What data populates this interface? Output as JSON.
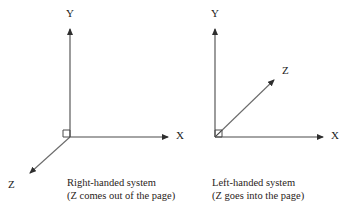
{
  "figure": {
    "type": "diagram",
    "background_color": "#ffffff",
    "line_color": "#4a4a4a",
    "text_color": "#2a2320"
  },
  "panels": [
    {
      "id": "right-handed",
      "caption_line1": "Right-handed system",
      "caption_line2": "(Z comes out of the page)",
      "origin": {
        "x": 70,
        "y": 137
      },
      "axes": [
        {
          "name": "Y",
          "label": "Y",
          "direction": "up",
          "tip": {
            "x": 70,
            "y": 25
          },
          "label_pos": {
            "x": 66,
            "y": 8
          }
        },
        {
          "name": "X",
          "label": "X",
          "direction": "right",
          "tip": {
            "x": 172,
            "y": 137
          },
          "label_pos": {
            "x": 176,
            "y": 130
          }
        },
        {
          "name": "Z",
          "label": "Z",
          "direction": "down-left",
          "tip": {
            "x": 27,
            "y": 175
          },
          "label_pos": {
            "x": 8,
            "y": 179
          }
        }
      ],
      "right_angle_marker": true
    },
    {
      "id": "left-handed",
      "caption_line1": "Left-handed system",
      "caption_line2": "(Z goes into the page)",
      "origin": {
        "x": 215,
        "y": 137
      },
      "axes": [
        {
          "name": "Y",
          "label": "Y",
          "direction": "up",
          "tip": {
            "x": 215,
            "y": 25
          },
          "label_pos": {
            "x": 211,
            "y": 8
          }
        },
        {
          "name": "X",
          "label": "X",
          "direction": "right",
          "tip": {
            "x": 327,
            "y": 137
          },
          "label_pos": {
            "x": 331,
            "y": 130
          }
        },
        {
          "name": "Z",
          "label": "Z",
          "direction": "up-right",
          "tip": {
            "x": 277,
            "y": 77
          },
          "label_pos": {
            "x": 282,
            "y": 65
          }
        }
      ],
      "right_angle_marker": true
    }
  ],
  "captions": {
    "left": {
      "line1": "Right-handed system",
      "line2": "(Z comes out of the page)",
      "x": 67,
      "y": 177
    },
    "right": {
      "line1": "Left-handed system",
      "line2": "(Z goes into the page)",
      "x": 212,
      "y": 177
    }
  }
}
